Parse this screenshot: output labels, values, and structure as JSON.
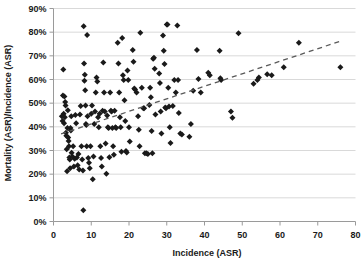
{
  "chart_data": {
    "type": "scatter",
    "title": "",
    "xlabel": "Incidence (ASR)",
    "ylabel": "Mortality (ASR)/Incidence (ASR)",
    "xlim": [
      0,
      80
    ],
    "ylim": [
      0,
      0.9
    ],
    "xticks": [
      "0",
      "10",
      "20",
      "30",
      "40",
      "50",
      "60",
      "70",
      "80"
    ],
    "xtick_values": [
      0,
      10,
      20,
      30,
      40,
      50,
      60,
      70,
      80
    ],
    "yticks": [
      "0%",
      "10%",
      "20%",
      "30%",
      "40%",
      "50%",
      "60%",
      "70%",
      "80%",
      "90%"
    ],
    "ytick_values": [
      0,
      0.1,
      0.2,
      0.3,
      0.4,
      0.5,
      0.6,
      0.7,
      0.8,
      0.9
    ],
    "grid": "horizontal",
    "legend": "none",
    "marker": "diamond",
    "marker_color": "#1a1a1a",
    "marker_size": 3,
    "gridline_color": "#d9d9d9",
    "axis_color": "#9a9a9a",
    "trendline": {
      "style": "dashed",
      "color": "#595959",
      "x0": 2,
      "y0": 0.37,
      "x1": 76,
      "y1": 0.762
    },
    "points": [
      [
        2.2,
        0.445
      ],
      [
        2.4,
        0.425
      ],
      [
        2.5,
        0.532
      ],
      [
        2.6,
        0.642
      ],
      [
        2.7,
        0.455
      ],
      [
        2.8,
        0.415
      ],
      [
        2.9,
        0.528
      ],
      [
        3.0,
        0.44
      ],
      [
        3.1,
        0.505
      ],
      [
        3.2,
        0.49
      ],
      [
        3.3,
        0.375
      ],
      [
        3.4,
        0.362
      ],
      [
        3.5,
        0.305
      ],
      [
        3.6,
        0.212
      ],
      [
        3.7,
        0.395
      ],
      [
        3.8,
        0.47
      ],
      [
        3.9,
        0.355
      ],
      [
        4.0,
        0.34
      ],
      [
        4.1,
        0.318
      ],
      [
        4.2,
        0.27
      ],
      [
        4.3,
        0.262
      ],
      [
        4.4,
        0.225
      ],
      [
        4.5,
        0.395
      ],
      [
        4.6,
        0.385
      ],
      [
        4.7,
        0.445
      ],
      [
        4.8,
        0.29
      ],
      [
        5.0,
        0.275
      ],
      [
        5.2,
        0.318
      ],
      [
        5.4,
        0.232
      ],
      [
        5.6,
        0.265
      ],
      [
        5.8,
        0.45
      ],
      [
        6.0,
        0.415
      ],
      [
        6.2,
        0.27
      ],
      [
        6.4,
        0.238
      ],
      [
        6.6,
        0.285
      ],
      [
        6.8,
        0.22
      ],
      [
        7.0,
        0.452
      ],
      [
        7.2,
        0.488
      ],
      [
        7.4,
        0.318
      ],
      [
        7.6,
        0.262
      ],
      [
        7.8,
        0.215
      ],
      [
        7.9,
        0.048
      ],
      [
        8.0,
        0.825
      ],
      [
        8.1,
        0.668
      ],
      [
        8.2,
        0.595
      ],
      [
        8.3,
        0.62
      ],
      [
        8.4,
        0.555
      ],
      [
        8.5,
        0.49
      ],
      [
        8.6,
        0.412
      ],
      [
        8.7,
        0.408
      ],
      [
        8.8,
        0.318
      ],
      [
        8.9,
        0.788
      ],
      [
        9.0,
        0.445
      ],
      [
        9.2,
        0.268
      ],
      [
        9.4,
        0.248
      ],
      [
        9.6,
        0.225
      ],
      [
        9.8,
        0.318
      ],
      [
        10.0,
        0.455
      ],
      [
        10.2,
        0.49
      ],
      [
        10.4,
        0.178
      ],
      [
        10.6,
        0.275
      ],
      [
        10.8,
        0.412
      ],
      [
        11.0,
        0.465
      ],
      [
        11.2,
        0.545
      ],
      [
        11.4,
        0.608
      ],
      [
        11.6,
        0.592
      ],
      [
        11.8,
        0.44
      ],
      [
        12.0,
        0.398
      ],
      [
        12.2,
        0.455
      ],
      [
        12.4,
        0.318
      ],
      [
        12.6,
        0.268
      ],
      [
        12.8,
        0.232
      ],
      [
        13.0,
        0.468
      ],
      [
        13.2,
        0.672
      ],
      [
        13.4,
        0.545
      ],
      [
        13.6,
        0.465
      ],
      [
        13.8,
        0.33
      ],
      [
        14.0,
        0.202
      ],
      [
        14.2,
        0.448
      ],
      [
        14.4,
        0.398
      ],
      [
        14.6,
        0.395
      ],
      [
        14.8,
        0.272
      ],
      [
        15.0,
        0.545
      ],
      [
        15.2,
        0.468
      ],
      [
        15.4,
        0.465
      ],
      [
        15.6,
        0.395
      ],
      [
        15.8,
        0.318
      ],
      [
        16.0,
        0.282
      ],
      [
        16.2,
        0.468
      ],
      [
        16.4,
        0.398
      ],
      [
        16.6,
        0.395
      ],
      [
        17.0,
        0.755
      ],
      [
        17.2,
        0.668
      ],
      [
        17.4,
        0.545
      ],
      [
        17.6,
        0.44
      ],
      [
        17.8,
        0.398
      ],
      [
        18.0,
        0.295
      ],
      [
        18.2,
        0.775
      ],
      [
        18.4,
        0.618
      ],
      [
        18.6,
        0.598
      ],
      [
        18.8,
        0.512
      ],
      [
        19.0,
        0.425
      ],
      [
        19.2,
        0.298
      ],
      [
        19.4,
        0.292
      ],
      [
        19.6,
        0.638
      ],
      [
        19.8,
        0.598
      ],
      [
        20.0,
        0.398
      ],
      [
        20.2,
        0.338
      ],
      [
        21.0,
        0.725
      ],
      [
        21.2,
        0.675
      ],
      [
        21.4,
        0.562
      ],
      [
        21.6,
        0.558
      ],
      [
        22.0,
        0.545
      ],
      [
        22.4,
        0.445
      ],
      [
        22.6,
        0.388
      ],
      [
        22.8,
        0.318
      ],
      [
        23.0,
        0.798
      ],
      [
        23.4,
        0.565
      ],
      [
        23.8,
        0.478
      ],
      [
        24.0,
        0.478
      ],
      [
        24.2,
        0.288
      ],
      [
        24.6,
        0.288
      ],
      [
        25.0,
        0.285
      ],
      [
        25.4,
        0.492
      ],
      [
        25.6,
        0.565
      ],
      [
        25.8,
        0.525
      ],
      [
        26.0,
        0.382
      ],
      [
        26.2,
        0.288
      ],
      [
        26.4,
        0.688
      ],
      [
        26.6,
        0.692
      ],
      [
        26.8,
        0.645
      ],
      [
        27.0,
        0.452
      ],
      [
        28.0,
        0.625
      ],
      [
        28.2,
        0.585
      ],
      [
        28.4,
        0.465
      ],
      [
        28.6,
        0.372
      ],
      [
        29.0,
        0.786
      ],
      [
        29.2,
        0.722
      ],
      [
        29.4,
        0.665
      ],
      [
        29.6,
        0.482
      ],
      [
        29.8,
        0.478
      ],
      [
        30.0,
        0.832
      ],
      [
        30.2,
        0.832
      ],
      [
        30.4,
        0.565
      ],
      [
        30.6,
        0.486
      ],
      [
        30.8,
        0.398
      ],
      [
        31.0,
        0.332
      ],
      [
        31.6,
        0.488
      ],
      [
        32.0,
        0.598
      ],
      [
        32.4,
        0.545
      ],
      [
        32.8,
        0.828
      ],
      [
        33.0,
        0.598
      ],
      [
        33.2,
        0.458
      ],
      [
        33.6,
        0.372
      ],
      [
        34.0,
        0.368
      ],
      [
        36.0,
        0.358
      ],
      [
        36.4,
        0.412
      ],
      [
        37.0,
        0.552
      ],
      [
        38.0,
        0.725
      ],
      [
        38.4,
        0.602
      ],
      [
        39.0,
        0.545
      ],
      [
        41.0,
        0.628
      ],
      [
        41.4,
        0.618
      ],
      [
        44.0,
        0.722
      ],
      [
        44.2,
        0.605
      ],
      [
        44.4,
        0.598
      ],
      [
        47.0,
        0.465
      ],
      [
        47.4,
        0.438
      ],
      [
        49.0,
        0.795
      ],
      [
        53.0,
        0.582
      ],
      [
        54.0,
        0.598
      ],
      [
        54.4,
        0.608
      ],
      [
        56.6,
        0.622
      ],
      [
        57.8,
        0.618
      ],
      [
        61.0,
        0.652
      ],
      [
        65.0,
        0.755
      ],
      [
        76.0,
        0.652
      ]
    ]
  }
}
